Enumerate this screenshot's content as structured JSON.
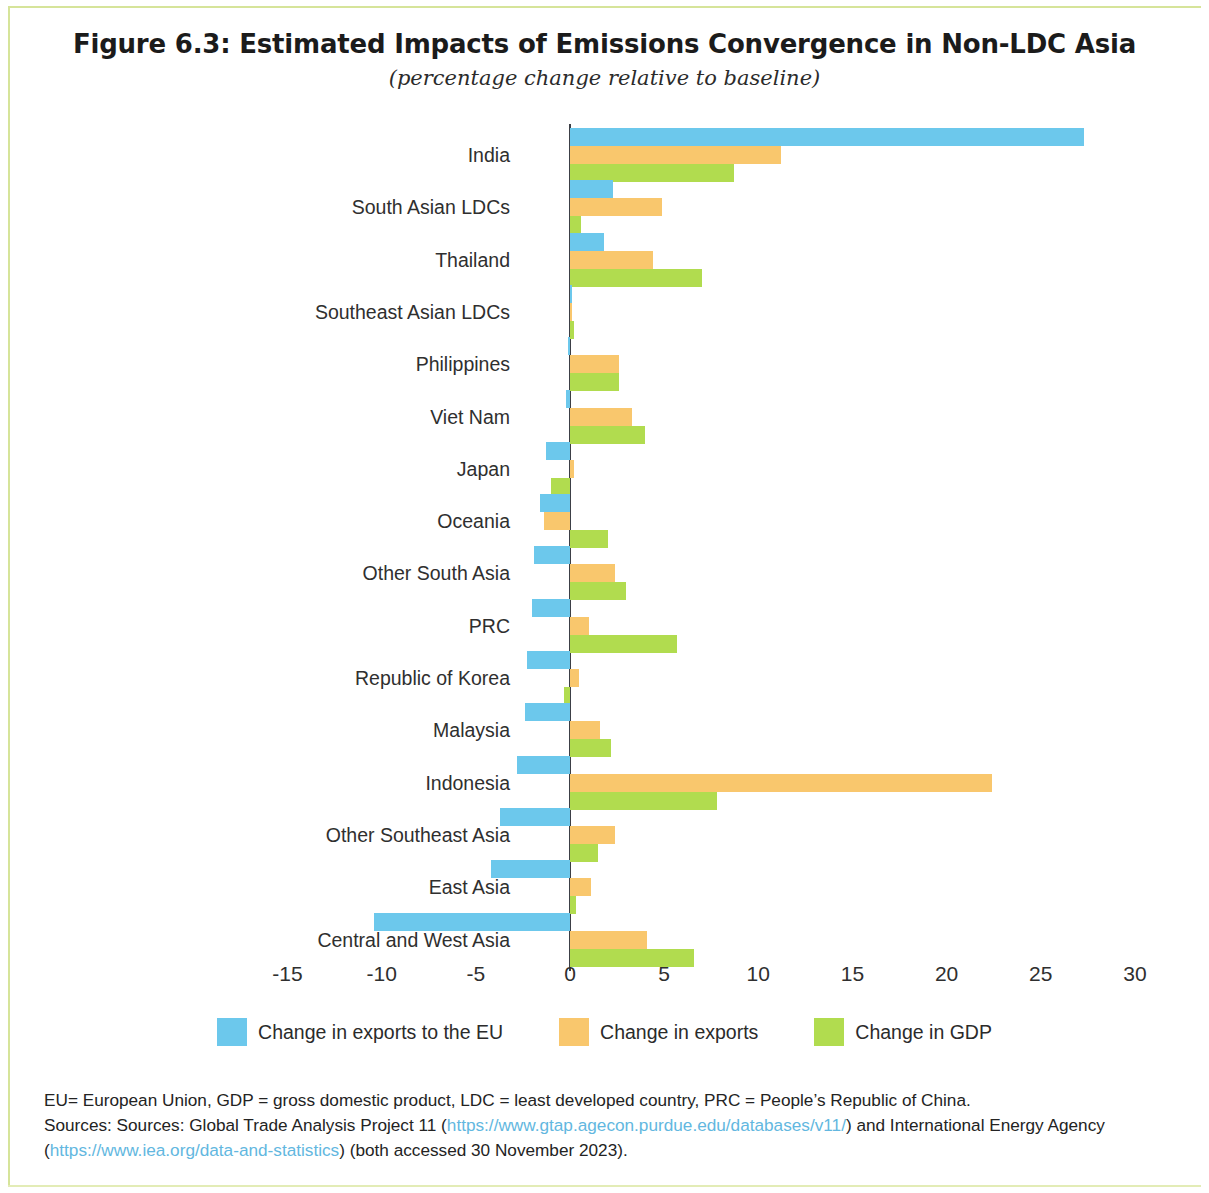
{
  "figure": {
    "title": "Figure 6.3: Estimated Impacts of Emissions Convergence in Non-LDC Asia",
    "subtitle": "(percentage change relative to baseline)"
  },
  "legend": {
    "items": [
      {
        "label": "Change in exports to the EU",
        "color": "#6cc8ec"
      },
      {
        "label": "Change in exports",
        "color": "#f9c76d"
      },
      {
        "label": "Change in GDP",
        "color": "#b1dc4f"
      }
    ]
  },
  "notes": {
    "line1": "EU= European Union, GDP = gross domestic product, LDC = least developed country, PRC = People’s Republic of China.",
    "line2_a": "Sources: Sources: Global Trade Analysis Project 11 (",
    "line2_url": "https://www.gtap.agecon.purdue.edu/databases/v11/",
    "line2_b": ") and International Energy Agency",
    "line3_a": "(",
    "line3_url": "https://www.iea.org/data-and-statistics",
    "line3_b": ") (both accessed 30 November 2023)."
  },
  "chart_data": {
    "type": "bar",
    "orientation": "horizontal",
    "title": "Figure 6.3: Estimated Impacts of Emissions Convergence in Non-LDC Asia",
    "subtitle": "(percentage change relative to baseline)",
    "xlabel": "",
    "ylabel": "",
    "xlim": [
      -17.5,
      31.5
    ],
    "xticks": [
      -15,
      -10,
      -5,
      0,
      5,
      10,
      15,
      20,
      25,
      30
    ],
    "xtick_labels": [
      "-15",
      "-10",
      "-5",
      "0",
      "5",
      "10",
      "15",
      "20",
      "25",
      "30"
    ],
    "grid": false,
    "legend_position": "bottom",
    "categories": [
      "India",
      "South Asian LDCs",
      "Thailand",
      "Southeast Asian LDCs",
      "Philippines",
      "Viet Nam",
      "Japan",
      "Oceania",
      "Other South Asia",
      "PRC",
      "Republic of Korea",
      "Malaysia",
      "Indonesia",
      "Other Southeast Asia",
      "East Asia",
      "Central and West Asia"
    ],
    "series": [
      {
        "name": "Change in exports to the EU",
        "color": "#6cc8ec",
        "values": [
          27.3,
          2.3,
          1.8,
          0.1,
          -0.1,
          -0.2,
          -1.3,
          -1.6,
          -1.9,
          -2.0,
          -2.3,
          -2.4,
          -2.8,
          -3.7,
          -4.2,
          -10.4
        ]
      },
      {
        "name": "Change in exports",
        "color": "#f9c76d",
        "values": [
          11.2,
          4.9,
          4.4,
          0.05,
          2.6,
          3.3,
          0.2,
          -1.4,
          2.4,
          1.0,
          0.5,
          1.6,
          22.4,
          2.4,
          1.1,
          4.1
        ]
      },
      {
        "name": "Change in GDP",
        "color": "#b1dc4f",
        "values": [
          8.7,
          0.6,
          7.0,
          0.2,
          2.6,
          4.0,
          -1.0,
          2.0,
          3.0,
          5.7,
          -0.3,
          2.2,
          7.8,
          1.5,
          0.3,
          6.6
        ]
      }
    ]
  }
}
